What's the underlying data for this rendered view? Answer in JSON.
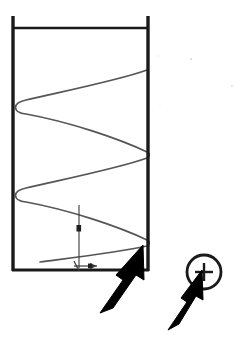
{
  "figure": {
    "title": "Helical coil inside cylindrical vessel",
    "background_color": "#ffffff",
    "width": 238,
    "height": 343
  },
  "vessel": {
    "name": "cylindrical-vessel",
    "stroke_color": "#1a1a1a",
    "stroke_width": 3,
    "left_x": 13,
    "right_x": 148,
    "top_y": 27,
    "bottom_y": 270,
    "wall_overshoot_top_y": 16,
    "open_top": true
  },
  "helix": {
    "name": "helical-coil",
    "stroke_color": "#555555",
    "stroke_width": 1.6,
    "turns": 4,
    "start_y": 70,
    "end_y": 262,
    "fill": "none",
    "description": "continuous spiral spanning vessel width"
  },
  "dimension": {
    "name": "pitch-dimension",
    "label": "a",
    "arrow_label": "e",
    "stroke_color": "#3a3a3a",
    "vertical_line_x": 79,
    "vertical_top_y": 205,
    "vertical_bottom_y": 268,
    "marker_y": 228,
    "horizontal_y": 266,
    "horizontal_x1": 74,
    "horizontal_x2": 97
  },
  "callouts": [
    {
      "name": "callout-arrow-coil",
      "target": "helix-bottom-turn",
      "color": "#000000",
      "tip_x": 143,
      "tip_y": 245,
      "tail_x": 100,
      "tail_y": 312
    },
    {
      "name": "callout-arrow-marker",
      "target": "plus-marker",
      "color": "#000000",
      "tip_x": 199,
      "tip_y": 270,
      "tail_x": 168,
      "tail_y": 328
    }
  ],
  "plus_marker": {
    "name": "plus-circle-marker",
    "symbol": "+",
    "stroke_color": "#1a1a1a",
    "center_x": 204,
    "center_y": 272,
    "radius": 17,
    "stroke_width": 2.6
  },
  "speckles": [
    {
      "x": 191,
      "y": 59,
      "r": 1.0,
      "opacity": 0.18
    },
    {
      "x": 232,
      "y": 86,
      "r": 0.9,
      "opacity": 0.14
    },
    {
      "x": 158,
      "y": 56,
      "r": 0.7,
      "opacity": 0.1
    },
    {
      "x": 160,
      "y": 105,
      "r": 0.6,
      "opacity": 0.1
    }
  ],
  "colors": {
    "ink": "#1a1a1a",
    "coil": "#555555",
    "annotation": "#3a3a3a",
    "paper": "#ffffff"
  }
}
